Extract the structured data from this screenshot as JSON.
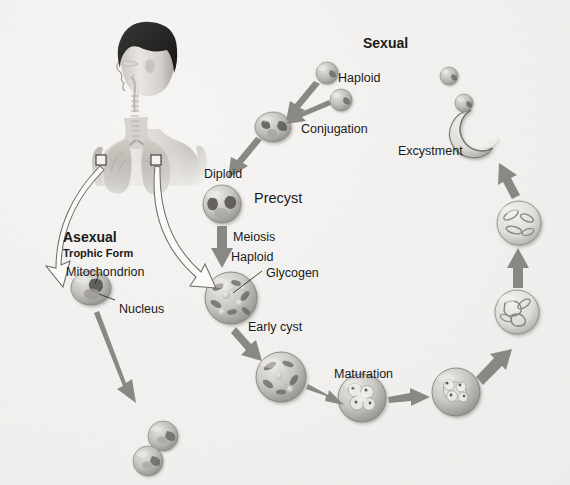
{
  "figure": {
    "background_color": "#f2f1ef",
    "text_color": "#1a1a1a",
    "arrow_color": "#8a8a8a",
    "cell_color": "#b9b7b2"
  },
  "headings": [
    {
      "name": "asexual",
      "label": "Asexual",
      "sub": "Trophic Form",
      "x": 63,
      "y": 230
    },
    {
      "name": "sexual",
      "label": "Sexual",
      "sub": "",
      "x": 363,
      "y": 36
    }
  ],
  "labels": [
    {
      "name": "haploid-gamete-1",
      "text": "Haploid",
      "x": 338,
      "y": 72,
      "size": "md"
    },
    {
      "name": "conjugation",
      "text": "Conjugation",
      "x": 301,
      "y": 123,
      "size": "md"
    },
    {
      "name": "diploid",
      "text": "Diploid",
      "x": 204,
      "y": 168,
      "size": "md"
    },
    {
      "name": "precyst",
      "text": "Precyst",
      "x": 254,
      "y": 191,
      "size": "hd"
    },
    {
      "name": "meiosis",
      "text": "Meiosis",
      "x": 233,
      "y": 231,
      "size": "md"
    },
    {
      "name": "haploid-cyst",
      "text": "Haploid",
      "x": 231,
      "y": 251,
      "size": "md"
    },
    {
      "name": "glycogen",
      "text": "Glycogen",
      "x": 266,
      "y": 267,
      "size": "md"
    },
    {
      "name": "early-cyst",
      "text": "Early cyst",
      "x": 248,
      "y": 321,
      "size": "md"
    },
    {
      "name": "maturation",
      "text": "Maturation",
      "x": 334,
      "y": 368,
      "size": "md"
    },
    {
      "name": "excystment",
      "text": "Excystment",
      "x": 398,
      "y": 145,
      "size": "md"
    },
    {
      "name": "mitochondrion",
      "text": "Mitochondrion",
      "x": 66,
      "y": 266,
      "size": "md"
    },
    {
      "name": "nucleus",
      "text": "Nucleus",
      "x": 119,
      "y": 303,
      "size": "md"
    }
  ],
  "cells": [
    {
      "name": "haploid-gamete-1",
      "cx": 327,
      "cy": 73,
      "r": 11,
      "kind": "troph"
    },
    {
      "name": "haploid-gamete-2",
      "cx": 341,
      "cy": 100,
      "r": 11,
      "kind": "troph"
    },
    {
      "name": "conjugating-pair",
      "cx": 273,
      "cy": 127,
      "r": 16,
      "kind": "pair"
    },
    {
      "name": "precyst-diploid",
      "cx": 222,
      "cy": 204,
      "r": 19,
      "kind": "precyst"
    },
    {
      "name": "haploid-cyst",
      "cx": 231,
      "cy": 298,
      "r": 26,
      "kind": "glyco"
    },
    {
      "name": "early-cyst",
      "cx": 281,
      "cy": 377,
      "r": 25,
      "kind": "early"
    },
    {
      "name": "maturing-cyst",
      "cx": 362,
      "cy": 398,
      "r": 24,
      "kind": "mature"
    },
    {
      "name": "mature-cyst",
      "cx": 456,
      "cy": 392,
      "r": 24,
      "kind": "mature2"
    },
    {
      "name": "late-cyst",
      "cx": 517,
      "cy": 312,
      "r": 22,
      "kind": "late"
    },
    {
      "name": "pre-excyst-cyst",
      "cx": 519,
      "cy": 223,
      "r": 22,
      "kind": "late"
    },
    {
      "name": "trophic-form",
      "cx": 91,
      "cy": 288,
      "r": 19,
      "kind": "trophic-big"
    },
    {
      "name": "daughter-cell-1",
      "cx": 163,
      "cy": 436,
      "r": 15,
      "kind": "troph"
    },
    {
      "name": "daughter-cell-2",
      "cx": 148,
      "cy": 461,
      "r": 15,
      "kind": "troph"
    },
    {
      "name": "escaped-cell-1",
      "cx": 449,
      "cy": 76,
      "r": 9,
      "kind": "troph"
    },
    {
      "name": "escaped-cell-2",
      "cx": 464,
      "cy": 103,
      "r": 9,
      "kind": "troph"
    }
  ],
  "excysted_shell": {
    "name": "ruptured-cyst",
    "cx": 483,
    "cy": 132,
    "r": 24
  },
  "human": {
    "name": "human-torso-illustration",
    "callout_boxes": 2
  },
  "arrows": {
    "gray": [
      {
        "name": "arrow-gamete1-to-conjugation"
      },
      {
        "name": "arrow-gamete2-to-conjugation"
      },
      {
        "name": "arrow-conjugation-to-precyst"
      },
      {
        "name": "arrow-precyst-to-haploid-cyst"
      },
      {
        "name": "arrow-haploid-to-early-cyst"
      },
      {
        "name": "arrow-early-to-maturing"
      },
      {
        "name": "arrow-maturing-to-mature"
      },
      {
        "name": "arrow-mature-to-late"
      },
      {
        "name": "arrow-late-to-pre-excyst"
      },
      {
        "name": "arrow-pre-excyst-to-excystment"
      },
      {
        "name": "arrow-trophic-to-daughters"
      }
    ],
    "outline": [
      {
        "name": "arrow-lung-to-trophic-form"
      },
      {
        "name": "arrow-lung-to-haploid-cyst"
      }
    ]
  }
}
